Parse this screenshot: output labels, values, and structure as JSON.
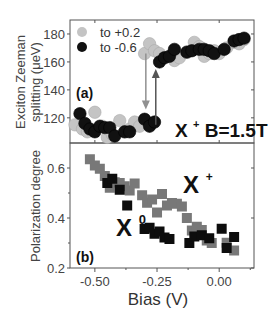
{
  "chart_data": [
    {
      "panel": "(a)",
      "type": "scatter",
      "title": "",
      "xlabel": "Bias (V)",
      "ylabel": "Exciton Zeeman splitting (μeV)",
      "ylabel_lines": [
        "Exciton Zeeman",
        "splitting (μeV)"
      ],
      "xlim": [
        -0.6,
        0.14
      ],
      "ylim": [
        102,
        190
      ],
      "yticks": [
        120,
        140,
        160,
        180
      ],
      "ytick_labels": [
        "120",
        "140",
        "160",
        "180"
      ],
      "grid": false,
      "legend_position": "upper left",
      "annotation": {
        "text_main": "X",
        "text_sup": "+",
        "text_rest": " B=1.5T"
      },
      "arrows": [
        {
          "series": "to +0.2",
          "x": -0.295,
          "from": 166,
          "to": 126,
          "direction": "down",
          "color": "#909090"
        },
        {
          "series": "to -0.6",
          "x": -0.255,
          "from": 115,
          "to": 155,
          "direction": "up",
          "color": "#555555"
        }
      ],
      "series": [
        {
          "name": "to +0.2",
          "marker": "circle",
          "color": "#c4c4c4",
          "points": [
            [
              -0.58,
              115
            ],
            [
              -0.55,
              112
            ],
            [
              -0.53,
              110
            ],
            [
              -0.5,
              124
            ],
            [
              -0.47,
              114
            ],
            [
              -0.45,
              106
            ],
            [
              -0.43,
              108
            ],
            [
              -0.4,
              118
            ],
            [
              -0.38,
              110
            ],
            [
              -0.36,
              112
            ],
            [
              -0.34,
              117
            ],
            [
              -0.32,
              114
            ],
            [
              -0.3,
              166
            ],
            [
              -0.28,
              173
            ],
            [
              -0.26,
              168
            ],
            [
              -0.24,
              166
            ],
            [
              -0.22,
              163
            ],
            [
              -0.2,
              164
            ],
            [
              -0.18,
              161
            ],
            [
              -0.16,
              163
            ],
            [
              -0.13,
              167
            ],
            [
              -0.1,
              174
            ],
            [
              -0.08,
              171
            ],
            [
              -0.06,
              164
            ],
            [
              -0.04,
              166
            ],
            [
              -0.02,
              168
            ],
            [
              0.0,
              166
            ],
            [
              0.03,
              170
            ],
            [
              0.06,
              174
            ],
            [
              0.08,
              173
            ],
            [
              0.1,
              176
            ]
          ]
        },
        {
          "name": "to -0.6",
          "marker": "circle",
          "color": "#111111",
          "points": [
            [
              -0.56,
              123
            ],
            [
              -0.54,
              116
            ],
            [
              -0.52,
              112
            ],
            [
              -0.5,
              110
            ],
            [
              -0.48,
              114
            ],
            [
              -0.46,
              113
            ],
            [
              -0.44,
              113
            ],
            [
              -0.42,
              107
            ],
            [
              -0.38,
              110
            ],
            [
              -0.36,
              110
            ],
            [
              -0.3,
              119
            ],
            [
              -0.28,
              114
            ],
            [
              -0.26,
              117
            ],
            [
              -0.24,
              160
            ],
            [
              -0.22,
              163
            ],
            [
              -0.2,
              164
            ],
            [
              -0.18,
              169
            ],
            [
              -0.13,
              167
            ],
            [
              -0.11,
              168
            ],
            [
              -0.08,
              169
            ],
            [
              -0.06,
              169
            ],
            [
              -0.04,
              168
            ],
            [
              -0.02,
              166
            ],
            [
              0.02,
              169
            ],
            [
              0.06,
              175
            ],
            [
              0.08,
              176
            ],
            [
              0.1,
              177
            ]
          ]
        }
      ]
    },
    {
      "panel": "(b)",
      "type": "scatter",
      "title": "",
      "xlabel": "Bias (V)",
      "ylabel": "Polarization degree",
      "xlim": [
        -0.6,
        0.14
      ],
      "ylim": [
        0.2,
        0.7
      ],
      "xticks": [
        -0.5,
        -0.25,
        0.0
      ],
      "xtick_labels": [
        "-0.50",
        "-0.25",
        "0.00"
      ],
      "yticks": [
        0.2,
        0.4,
        0.6
      ],
      "ytick_labels": [
        "0.2",
        "0.4",
        "0.6"
      ],
      "grid": false,
      "labels": [
        {
          "text_main": "X",
          "text_sup": "+",
          "x": -0.12,
          "y": 0.5
        },
        {
          "text_main": "X",
          "text_sup": "0",
          "x": -0.37,
          "y": 0.37
        }
      ],
      "series": [
        {
          "name": "X+",
          "marker": "square",
          "color": "#787878",
          "points": [
            [
              -0.52,
              0.635
            ],
            [
              -0.5,
              0.61
            ],
            [
              -0.48,
              0.597
            ],
            [
              -0.46,
              0.568
            ],
            [
              -0.44,
              0.521
            ],
            [
              -0.42,
              0.543
            ],
            [
              -0.4,
              0.54
            ],
            [
              -0.38,
              0.527
            ],
            [
              -0.36,
              0.51
            ],
            [
              -0.34,
              0.538
            ],
            [
              -0.31,
              0.491
            ],
            [
              -0.29,
              0.461
            ],
            [
              -0.27,
              0.474
            ],
            [
              -0.25,
              0.422
            ],
            [
              -0.23,
              0.496
            ],
            [
              -0.21,
              0.45
            ],
            [
              -0.19,
              0.46
            ],
            [
              -0.17,
              0.457
            ],
            [
              -0.15,
              0.446
            ],
            [
              -0.13,
              0.4
            ],
            [
              -0.11,
              0.35
            ],
            [
              -0.09,
              0.365
            ],
            [
              -0.07,
              0.352
            ],
            [
              -0.05,
              0.31
            ],
            [
              -0.03,
              0.3
            ],
            [
              0.03,
              0.301
            ],
            [
              0.06,
              0.27
            ]
          ]
        },
        {
          "name": "X0",
          "marker": "square",
          "color": "#0d0d0d",
          "points": [
            [
              -0.45,
              0.54
            ],
            [
              -0.43,
              0.557
            ],
            [
              -0.4,
              0.513
            ],
            [
              -0.37,
              0.45
            ],
            [
              -0.3,
              0.356
            ],
            [
              -0.28,
              0.361
            ],
            [
              -0.26,
              0.337
            ],
            [
              -0.24,
              0.346
            ],
            [
              -0.22,
              0.322
            ],
            [
              -0.2,
              0.316
            ],
            [
              -0.12,
              0.3
            ],
            [
              -0.1,
              0.326
            ],
            [
              -0.07,
              0.331
            ],
            [
              -0.04,
              0.319
            ],
            [
              0.01,
              0.357
            ],
            [
              0.03,
              0.28
            ],
            [
              0.06,
              0.324
            ]
          ]
        }
      ]
    }
  ]
}
